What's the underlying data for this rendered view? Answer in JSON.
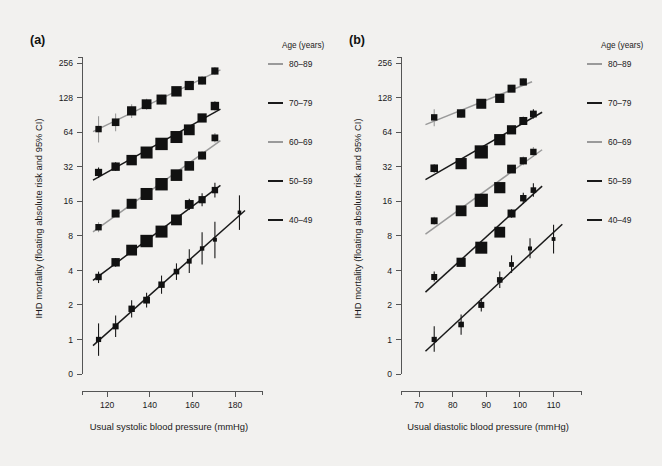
{
  "figure": {
    "background_color": "#f2f1ef",
    "panels": [
      {
        "id": "a",
        "label": "(a)",
        "xlabel": "Usual systolic blood pressure (mmHg)",
        "ylabel": "IHD mortality (floating absolute risk and 95% CI)",
        "xticks": [
          120,
          140,
          160,
          180
        ],
        "xlim": [
          112,
          186
        ],
        "yticks": [
          "0",
          "1",
          "2",
          "4",
          "8",
          "16",
          "32",
          "64",
          "128",
          "256"
        ],
        "ylim": [
          0.5,
          300
        ]
      },
      {
        "id": "b",
        "label": "(b)",
        "xlabel": "Usual diastolic blood pressure (mmHg)",
        "ylabel": "IHD mortality (floating absolute risk and 95% CI)",
        "xticks": [
          70,
          80,
          90,
          100,
          110
        ],
        "xlim": [
          67,
          114
        ],
        "yticks": [
          "0",
          "1",
          "2",
          "4",
          "8",
          "16",
          "32",
          "64",
          "128",
          "256"
        ],
        "ylim": [
          0.5,
          300
        ]
      }
    ],
    "legend": {
      "title": "Age (years)",
      "entries": [
        {
          "label": "80–89",
          "color": "#9a9a9a"
        },
        {
          "label": "70–79",
          "color": "#1a1a1a"
        },
        {
          "label": "60–69",
          "color": "#9a9a9a"
        },
        {
          "label": "50–59",
          "color": "#1a1a1a"
        },
        {
          "label": "40–49",
          "color": "#1a1a1a"
        }
      ]
    }
  },
  "chart_data": [
    {
      "type": "scatter",
      "panel": "a",
      "title": "(a)",
      "xlabel": "Usual systolic blood pressure (mmHg)",
      "ylabel": "IHD mortality (floating absolute risk and 95% CI)",
      "xlim": [
        112,
        186
      ],
      "ylim": [
        0.5,
        300
      ],
      "yscale": "log",
      "xticks": [
        120,
        140,
        160,
        180
      ],
      "yticks": [
        0,
        1,
        2,
        4,
        8,
        16,
        32,
        64,
        128,
        256
      ],
      "grid": false,
      "legend_position": "right",
      "series": [
        {
          "name": "80–89",
          "color": "#9a9a9a",
          "x": [
            116,
            124,
            131.5,
            138.5,
            145.5,
            152.5,
            158.5,
            164.5,
            170.5
          ],
          "y": [
            68,
            78,
            98,
            112,
            123,
            145,
            163,
            180,
            218
          ],
          "ci_low": [
            52,
            65,
            85,
            100,
            112,
            133,
            150,
            166,
            202
          ],
          "ci_high": [
            88,
            93,
            112,
            125,
            135,
            158,
            177,
            196,
            236
          ],
          "marker_sizes": [
            3.2,
            3.8,
            4.6,
            4.9,
            5.0,
            5.2,
            4.6,
            4.0,
            3.6
          ]
        },
        {
          "name": "70–79",
          "color": "#1a1a1a",
          "x": [
            116,
            124,
            131.5,
            138.5,
            145.5,
            152.5,
            158.5,
            164.5,
            170.5
          ],
          "y": [
            28.5,
            32,
            36.5,
            42.5,
            50.5,
            58,
            67,
            85,
            108
          ],
          "ci_low": [
            25.5,
            29.5,
            34.5,
            40.5,
            48,
            55,
            63,
            79,
            99
          ],
          "ci_high": [
            31.5,
            35,
            39,
            45,
            53.5,
            61.5,
            71,
            92,
            118
          ],
          "marker_sizes": [
            3.6,
            4.2,
            5.2,
            6.0,
            6.2,
            6.0,
            5.4,
            4.6,
            4.2
          ]
        },
        {
          "name": "60–69",
          "color": "#9a9a9a",
          "x": [
            116,
            124,
            131.5,
            138.5,
            145.5,
            152.5,
            158.5,
            164.5,
            170.5
          ],
          "y": [
            9.5,
            12.5,
            15.2,
            18.5,
            22.5,
            27,
            32.5,
            40,
            57
          ],
          "ci_low": [
            8.6,
            11.7,
            14.4,
            17.6,
            21.4,
            25.6,
            30.6,
            37,
            52
          ],
          "ci_high": [
            10.5,
            13.4,
            16.1,
            19.5,
            23.7,
            28.5,
            34.5,
            43.5,
            63
          ],
          "marker_sizes": [
            3.2,
            4.0,
            5.0,
            6.0,
            6.2,
            5.8,
            4.8,
            4.0,
            3.4
          ]
        },
        {
          "name": "50–59",
          "color": "#1a1a1a",
          "x": [
            116,
            124,
            131.5,
            138.5,
            145.5,
            152.5,
            158.5,
            164.5,
            170.5
          ],
          "y": [
            3.5,
            4.7,
            6.0,
            7.2,
            8.7,
            11.0,
            15.0,
            16.5,
            20.0
          ],
          "ci_low": [
            3.1,
            4.3,
            5.6,
            6.7,
            8.1,
            10.1,
            13.4,
            14.5,
            17.2
          ],
          "ci_high": [
            3.9,
            5.1,
            6.4,
            7.7,
            9.4,
            12.0,
            16.8,
            18.8,
            23.2
          ],
          "marker_sizes": [
            3.2,
            4.2,
            5.4,
            6.2,
            6.0,
            5.4,
            4.4,
            3.6,
            3.2
          ]
        },
        {
          "name": "40–49",
          "color": "#1a1a1a",
          "x": [
            116,
            124,
            131.5,
            138.5,
            145.5,
            152.5,
            158.5,
            164.5,
            170.5,
            182
          ],
          "y": [
            1.0,
            1.3,
            1.85,
            2.2,
            3.0,
            3.9,
            4.8,
            6.2,
            7.4,
            12.8
          ],
          "ci_low": [
            0.72,
            1.05,
            1.55,
            1.9,
            2.5,
            3.3,
            3.8,
            4.5,
            5.1,
            9.0
          ],
          "ci_high": [
            1.38,
            1.62,
            2.2,
            2.55,
            3.6,
            4.6,
            6.1,
            8.6,
            10.6,
            18.0
          ],
          "marker_sizes": [
            2.6,
            3.0,
            3.2,
            3.4,
            3.2,
            2.8,
            2.4,
            2.2,
            2.0,
            1.8
          ]
        }
      ]
    },
    {
      "type": "scatter",
      "panel": "b",
      "title": "(b)",
      "xlabel": "Usual diastolic blood pressure (mmHg)",
      "ylabel": "IHD mortality (floating absolute risk and 95% CI)",
      "xlim": [
        67,
        114
      ],
      "ylim": [
        0.5,
        300
      ],
      "yscale": "log",
      "xticks": [
        70,
        80,
        90,
        100,
        110
      ],
      "yticks": [
        0,
        1,
        2,
        4,
        8,
        16,
        32,
        64,
        128,
        256
      ],
      "grid": false,
      "legend_position": "right",
      "series": [
        {
          "name": "80–89",
          "color": "#9a9a9a",
          "x": [
            74.5,
            82.5,
            88.5,
            94,
            97.5,
            101
          ],
          "y": [
            86,
            93,
            113,
            126,
            153,
            175
          ],
          "ci_low": [
            72,
            85,
            106,
            118,
            143,
            163
          ],
          "ci_high": [
            101,
            102,
            121,
            135,
            164,
            189
          ],
          "marker_sizes": [
            3.2,
            4.2,
            5.0,
            4.6,
            4.0,
            3.6
          ]
        },
        {
          "name": "70–79",
          "color": "#1a1a1a",
          "x": [
            74.5,
            82.5,
            88.5,
            94,
            97.5,
            101,
            104
          ],
          "y": [
            31,
            34,
            43,
            55,
            67,
            80,
            92
          ],
          "ci_low": [
            28.5,
            32,
            41,
            52,
            63,
            74,
            84
          ],
          "ci_high": [
            33.5,
            36.5,
            45,
            58.5,
            71,
            87,
            101
          ],
          "marker_sizes": [
            3.8,
            5.6,
            6.6,
            5.6,
            4.6,
            4.0,
            3.4
          ]
        },
        {
          "name": "60–69",
          "color": "#9a9a9a",
          "x": [
            74.5,
            82.5,
            88.5,
            94,
            97.5,
            101,
            104
          ],
          "y": [
            10.8,
            13.2,
            16.3,
            21.0,
            30.5,
            36.0,
            43.0
          ],
          "ci_low": [
            10.0,
            12.5,
            15.5,
            19.8,
            28.6,
            33.0,
            39.0
          ],
          "ci_high": [
            11.7,
            14.0,
            17.2,
            22.3,
            32.5,
            39.3,
            47.4
          ],
          "marker_sizes": [
            3.4,
            5.4,
            6.6,
            5.6,
            4.4,
            3.6,
            3.2
          ]
        },
        {
          "name": "50–59",
          "color": "#1a1a1a",
          "x": [
            74.5,
            82.5,
            88.5,
            94,
            97.5,
            101,
            104
          ],
          "y": [
            3.5,
            4.7,
            6.3,
            8.6,
            12.5,
            17.0,
            20.0
          ],
          "ci_low": [
            3.2,
            4.4,
            6.0,
            8.1,
            11.5,
            15.2,
            17.5
          ],
          "ci_high": [
            3.9,
            5.1,
            6.7,
            9.2,
            13.6,
            19.0,
            22.9
          ],
          "marker_sizes": [
            3.0,
            4.6,
            6.0,
            5.4,
            4.0,
            3.2,
            2.8
          ]
        },
        {
          "name": "40–49",
          "color": "#1a1a1a",
          "x": [
            74.5,
            82.5,
            88.5,
            94,
            97.5,
            103,
            110
          ],
          "y": [
            1.0,
            1.35,
            2.0,
            3.3,
            4.5,
            6.2,
            7.5
          ],
          "ci_low": [
            0.78,
            1.1,
            1.75,
            2.8,
            3.8,
            5.1,
            5.6
          ],
          "ci_high": [
            1.3,
            1.65,
            2.3,
            3.9,
            5.4,
            7.6,
            10.0
          ],
          "marker_sizes": [
            2.6,
            2.8,
            3.0,
            2.8,
            2.4,
            2.0,
            1.9
          ]
        }
      ]
    }
  ]
}
